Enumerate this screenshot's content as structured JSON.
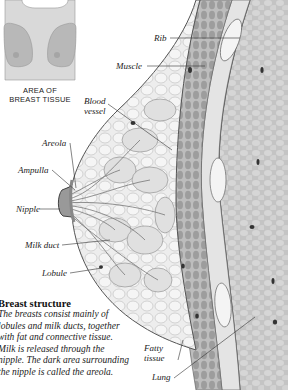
{
  "inset": {
    "caption_line1": "AREA OF",
    "caption_line2": "BREAST TISSUE",
    "colors": {
      "body": "#d9d9d9",
      "tissue": "#b8b8b8",
      "outline": "#999999"
    }
  },
  "labels": {
    "rib": "Rib",
    "muscle": "Muscle",
    "blood_vessel_line1": "Blood",
    "blood_vessel_line2": "vessel",
    "areola": "Areola",
    "ampulla": "Ampulla",
    "nipple": "Nipple",
    "milk_duct": "Milk duct",
    "lobule": "Lobule",
    "fatty_tissue_line1": "Fatty",
    "fatty_tissue_line2": "tissue",
    "lung": "Lung"
  },
  "description": {
    "title": "Breast structure",
    "lines": [
      "The breasts consist mainly of",
      "lobules and milk ducts, together",
      "with fat and connective tissue.",
      "Milk is released through the",
      "nipple. The dark area surrounding",
      "the nipple is called the areola."
    ]
  },
  "colors": {
    "breast_tissue": "#ececec",
    "muscle": "#a9a9a9",
    "lung": "#c9c9c9",
    "line": "#444444"
  }
}
